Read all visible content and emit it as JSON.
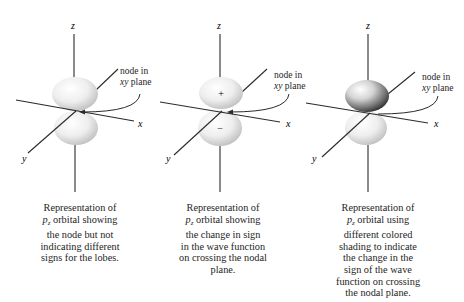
{
  "figure": {
    "panels": [
      {
        "id": "plain",
        "axes": {
          "z": "z",
          "x": "x",
          "y": "y"
        },
        "node_label": {
          "line1": "node in",
          "line2_italic": "xy",
          "line2_rest": " plane"
        },
        "lobe_signs": {
          "top": "",
          "bottom": ""
        },
        "shading": "uniform",
        "caption": {
          "line1": "Representation of",
          "orbital_p": "p",
          "orbital_sub": "z",
          "line2_rest": " orbital showing",
          "line3": "the node but not",
          "line4": "indicating different",
          "line5": "signs for the lobes."
        }
      },
      {
        "id": "signs",
        "axes": {
          "z": "z",
          "x": "x",
          "y": "y"
        },
        "node_label": {
          "line1": "node in",
          "line2_italic": "xy",
          "line2_rest": " plane"
        },
        "lobe_signs": {
          "top": "+",
          "bottom": "−"
        },
        "shading": "uniform",
        "caption": {
          "line1": "Representation of",
          "orbital_p": "p",
          "orbital_sub": "z",
          "line2_rest": " orbital showing",
          "line3": "the change in sign",
          "line4": "in the wave function",
          "line5": "on crossing the nodal",
          "line6": "plane."
        }
      },
      {
        "id": "shaded",
        "axes": {
          "z": "z",
          "x": "x",
          "y": "y"
        },
        "node_label": {
          "line1": "node in",
          "line2_italic": "xy",
          "line2_rest": " plane"
        },
        "lobe_signs": {
          "top": "",
          "bottom": ""
        },
        "shading": "top-dark",
        "caption": {
          "line1": "Representation of",
          "orbital_p": "p",
          "orbital_sub": "z",
          "line2_rest": " orbital using",
          "line3": "different colored",
          "line4": "shading to indicate",
          "line5": "the change in the",
          "line6": "sign of the wave",
          "line7": "function on crossing",
          "line8": "the nodal plane."
        }
      }
    ],
    "colors": {
      "lobe_light": "#f2f2f2",
      "lobe_mid": "#c8c8c8",
      "lobe_dark": "#555555",
      "axis": "#2a2a2a",
      "text": "#1e1e1e"
    }
  }
}
